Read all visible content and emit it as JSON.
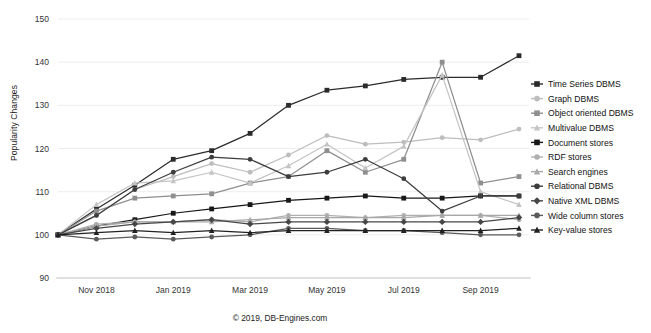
{
  "caption": "© 2019, DB-Engines.com",
  "axes": {
    "ylabel": "Popularity Changes",
    "ylim": [
      90,
      150
    ],
    "yticks": [
      90,
      100,
      110,
      120,
      130,
      140,
      150
    ],
    "xticks": [
      "Nov 2018",
      "Jan 2019",
      "Mar 2019",
      "May 2019",
      "Jul 2019",
      "Sep 2019"
    ],
    "grid": true,
    "gridcolor": "#e8e8e8",
    "axiscolor": "#c9c9c9"
  },
  "legend": {
    "position": "right",
    "items": [
      {
        "label": "Time Series DBMS",
        "color": "#2b2b2b",
        "marker": "square"
      },
      {
        "label": "Graph DBMS",
        "color": "#bdbdbd",
        "marker": "circle"
      },
      {
        "label": "Object oriented DBMS",
        "color": "#8f8f8f",
        "marker": "square"
      },
      {
        "label": "Multivalue DBMS",
        "color": "#c4c4c4",
        "marker": "triangle"
      },
      {
        "label": "Document stores",
        "color": "#181818",
        "marker": "square"
      },
      {
        "label": "RDF stores",
        "color": "#b0b0b0",
        "marker": "circle"
      },
      {
        "label": "Search engines",
        "color": "#a8a8a8",
        "marker": "triangle"
      },
      {
        "label": "Relational DBMS",
        "color": "#3d3d3d",
        "marker": "circle"
      },
      {
        "label": "Native XML DBMS",
        "color": "#474747",
        "marker": "diamond"
      },
      {
        "label": "Wide column stores",
        "color": "#5a5a5a",
        "marker": "circle"
      },
      {
        "label": "Key-value stores",
        "color": "#222222",
        "marker": "triangle"
      }
    ]
  },
  "chart_data": {
    "type": "line",
    "title": "",
    "xlabel": "",
    "ylabel": "Popularity Changes",
    "ylim": [
      90,
      150
    ],
    "grid": true,
    "x": [
      "Oct 2018",
      "Nov 2018",
      "Dec 2018",
      "Jan 2019",
      "Feb 2019",
      "Mar 2019",
      "Apr 2019",
      "May 2019",
      "Jun 2019",
      "Jul 2019",
      "Aug 2019",
      "Sep 2019",
      "Oct 2019"
    ],
    "series": [
      {
        "name": "Time Series DBMS",
        "color": "#2b2b2b",
        "marker": "square",
        "values": [
          100,
          106,
          111.5,
          117.5,
          119.5,
          123.5,
          130.0,
          133.5,
          134.5,
          136.0,
          136.5,
          136.5,
          141.5
        ]
      },
      {
        "name": "Graph DBMS",
        "color": "#bdbdbd",
        "marker": "circle",
        "values": [
          100,
          104.5,
          110.5,
          113.5,
          116.5,
          114.5,
          118.5,
          123.0,
          121.0,
          121.5,
          122.5,
          122.0,
          124.5
        ]
      },
      {
        "name": "Object oriented DBMS",
        "color": "#8f8f8f",
        "marker": "square",
        "values": [
          100,
          105.5,
          108.5,
          109.0,
          109.5,
          112.0,
          113.5,
          119.5,
          114.5,
          117.5,
          140.0,
          112.0,
          113.5
        ]
      },
      {
        "name": "Multivalue DBMS",
        "color": "#c4c4c4",
        "marker": "triangle",
        "values": [
          100,
          107.0,
          112.0,
          112.5,
          114.5,
          112.0,
          116.0,
          121.0,
          115.5,
          120.5,
          137.0,
          110.0,
          107.0
        ]
      },
      {
        "name": "Document stores",
        "color": "#181818",
        "marker": "square",
        "values": [
          100,
          102.0,
          103.5,
          105.0,
          106.0,
          107.0,
          108.0,
          108.5,
          109.0,
          108.5,
          108.5,
          109.0,
          109.0
        ]
      },
      {
        "name": "RDF stores",
        "color": "#b0b0b0",
        "marker": "circle",
        "values": [
          100,
          102.5,
          103.0,
          103.0,
          103.5,
          103.0,
          104.5,
          104.5,
          104.0,
          104.5,
          104.5,
          104.5,
          103.5
        ]
      },
      {
        "name": "Search engines",
        "color": "#a8a8a8",
        "marker": "triangle",
        "values": [
          100,
          102.0,
          103.0,
          103.0,
          103.0,
          103.5,
          104.0,
          104.0,
          104.0,
          104.0,
          104.5,
          104.5,
          104.5
        ]
      },
      {
        "name": "Relational DBMS",
        "color": "#3d3d3d",
        "marker": "circle",
        "values": [
          100,
          104.5,
          110.5,
          114.5,
          118.0,
          117.5,
          113.5,
          114.5,
          117.5,
          113.0,
          105.5,
          109.0,
          109.0
        ]
      },
      {
        "name": "Native XML DBMS",
        "color": "#474747",
        "marker": "diamond",
        "values": [
          100,
          101.5,
          102.5,
          103.0,
          103.5,
          102.5,
          103.0,
          103.0,
          103.0,
          103.0,
          103.0,
          103.0,
          104.0
        ]
      },
      {
        "name": "Wide column stores",
        "color": "#5a5a5a",
        "marker": "circle",
        "values": [
          100,
          99.0,
          99.5,
          99.0,
          99.5,
          100.0,
          101.5,
          101.5,
          101.0,
          101.0,
          100.5,
          100.0,
          100.0
        ]
      },
      {
        "name": "Key-value stores",
        "color": "#222222",
        "marker": "triangle",
        "values": [
          100,
          100.5,
          101.0,
          100.5,
          101.0,
          100.5,
          101.0,
          101.0,
          101.0,
          101.0,
          101.0,
          101.0,
          101.5
        ]
      }
    ]
  }
}
